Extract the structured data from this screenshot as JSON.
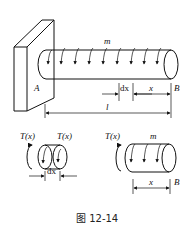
{
  "figure": {
    "caption": "图 12-14",
    "main": {
      "load_label": "m",
      "support_label": "A",
      "free_end_label": "B",
      "dim_dx": "dx",
      "dim_x": "x",
      "dim_l": "l"
    },
    "element_dx": {
      "left_torque": "T(x)",
      "right_torque": "T(x)",
      "dim_dx": "dx"
    },
    "segment_x": {
      "torque": "T(x)",
      "load_label": "m",
      "end_label": "B",
      "dim_x": "x"
    }
  }
}
